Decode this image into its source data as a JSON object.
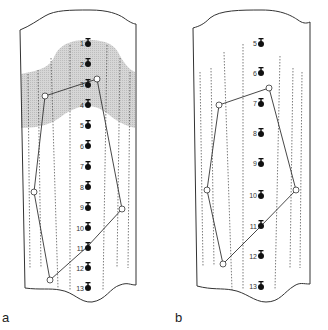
{
  "figure": {
    "panels": [
      {
        "id": "a",
        "label": "a",
        "electrodes": [
          {
            "n": "1",
            "y": 42
          },
          {
            "n": "2",
            "y": 63
          },
          {
            "n": "3",
            "y": 84
          },
          {
            "n": "4",
            "y": 104
          },
          {
            "n": "5",
            "y": 125
          },
          {
            "n": "6",
            "y": 146
          },
          {
            "n": "7",
            "y": 166
          },
          {
            "n": "8",
            "y": 187
          },
          {
            "n": "9",
            "y": 208
          },
          {
            "n": "10",
            "y": 228
          },
          {
            "n": "11",
            "y": 248
          },
          {
            "n": "12",
            "y": 268
          },
          {
            "n": "13",
            "y": 288
          }
        ],
        "shaded_region": "electrodes 1-4 band",
        "polygon_vertices": 6
      },
      {
        "id": "b",
        "label": "b",
        "electrodes": [
          {
            "n": "5",
            "y": 43
          },
          {
            "n": "6",
            "y": 73
          },
          {
            "n": "7",
            "y": 103
          },
          {
            "n": "8",
            "y": 133
          },
          {
            "n": "9",
            "y": 163
          },
          {
            "n": "10",
            "y": 195
          },
          {
            "n": "11",
            "y": 226
          },
          {
            "n": "12",
            "y": 256
          },
          {
            "n": "13",
            "y": 286
          }
        ],
        "polygon_vertices": 6
      }
    ],
    "colors": {
      "line": "#333333",
      "shade": "#cfcfcf",
      "marker": "#111111"
    }
  }
}
